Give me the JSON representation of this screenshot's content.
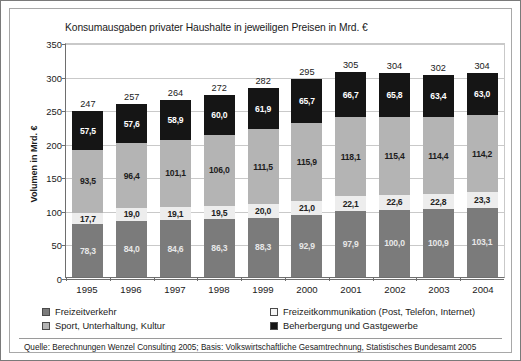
{
  "title": "Konsumausgaben privater Haushalte in jeweiligen Preisen in Mrd. €",
  "source": "Quelle: Berechnungen Wenzel Consulting 2005; Basis: Volkswirtschaftliche Gesamtrechnung, Statistisches Bundesamt 2005",
  "chart_data": {
    "type": "bar",
    "subtype": "stacked-column",
    "title": "Konsumausgaben privater Haushalte in jeweiligen Preisen in Mrd. €",
    "xlabel": "",
    "ylabel": "Volumen in Mrd. €",
    "ylim": [
      0,
      350
    ],
    "yticks": [
      0,
      50,
      100,
      150,
      200,
      250,
      300,
      350
    ],
    "ytick_labels": [
      "0",
      "50",
      "100",
      "150",
      "200",
      "250",
      "300",
      "350"
    ],
    "grid": true,
    "legend_position": "bottom",
    "categories": [
      "1995",
      "1996",
      "1997",
      "1998",
      "1999",
      "2000",
      "2001",
      "2002",
      "2003",
      "2004"
    ],
    "series": [
      {
        "name": "Freizeitverkehr",
        "color": "#7b7b7b",
        "values": [
          78.3,
          84.0,
          84.6,
          86.3,
          88.3,
          92.9,
          97.9,
          100.0,
          100.9,
          103.1
        ],
        "labels": [
          "78,3",
          "84,0",
          "84,6",
          "86,3",
          "88,3",
          "92,9",
          "97,9",
          "100,0",
          "100,9",
          "103,1"
        ]
      },
      {
        "name": "Freizeitkommunikation (Post, Telefon, Internet)",
        "color": "#ededed",
        "values": [
          17.7,
          19.0,
          19.1,
          19.5,
          20.0,
          21.0,
          22.1,
          22.6,
          22.8,
          23.3
        ],
        "labels": [
          "17,7",
          "19,0",
          "19,1",
          "19,5",
          "20,0",
          "21,0",
          "22,1",
          "22,6",
          "22,8",
          "23,3"
        ]
      },
      {
        "name": "Sport, Unterhaltung, Kultur",
        "color": "#b4b4b4",
        "values": [
          93.5,
          96.4,
          101.1,
          106.0,
          111.5,
          115.9,
          118.1,
          115.4,
          114.4,
          114.2
        ],
        "labels": [
          "93,5",
          "96,4",
          "101,1",
          "106,0",
          "111,5",
          "115,9",
          "118,1",
          "115,4",
          "114,4",
          "114,2"
        ]
      },
      {
        "name": "Beherbergung und Gastgewerbe",
        "color": "#151515",
        "values": [
          57.5,
          57.6,
          58.9,
          60.0,
          61.9,
          65.7,
          66.7,
          65.8,
          63.4,
          63.0
        ],
        "labels": [
          "57,5",
          "57,6",
          "58,9",
          "60,0",
          "61,9",
          "65,7",
          "66,7",
          "65,8",
          "63,4",
          "63,0"
        ]
      }
    ],
    "totals": [
      247,
      257,
      264,
      272,
      282,
      295,
      305,
      304,
      302,
      304
    ],
    "total_labels": [
      "247",
      "257",
      "264",
      "272",
      "282",
      "295",
      "305",
      "304",
      "302",
      "304"
    ]
  },
  "legend": [
    {
      "label": "Freizeitverkehr",
      "swatch": "sw0"
    },
    {
      "label": "Freizeitkommunikation (Post, Telefon, Internet)",
      "swatch": "sw1"
    },
    {
      "label": "Sport, Unterhaltung, Kultur",
      "swatch": "sw2"
    },
    {
      "label": "Beherbergung und Gastgewerbe",
      "swatch": "sw3"
    }
  ]
}
